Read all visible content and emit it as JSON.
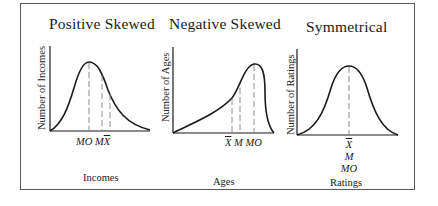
{
  "figure": {
    "panels": [
      {
        "title": "Positive Skewed",
        "ylabel": "Number of Incomes",
        "xlabel": "Incomes",
        "markers": [
          "MO",
          "M",
          "X"
        ],
        "marker_order_note": "left-to-right"
      },
      {
        "title": "Negative Skewed",
        "ylabel": "Number of Ages",
        "xlabel": "Ages",
        "markers": [
          "X",
          "M",
          "MO"
        ]
      },
      {
        "title": "Symmetrical",
        "ylabel": "Number of Ratings",
        "xlabel": "Ratings",
        "markers": [
          "X",
          "M",
          "MO"
        ]
      }
    ],
    "colors": {
      "line": "#1a1a1a",
      "dash": "#8a8a8a",
      "frame": "#5a5a5a"
    }
  }
}
